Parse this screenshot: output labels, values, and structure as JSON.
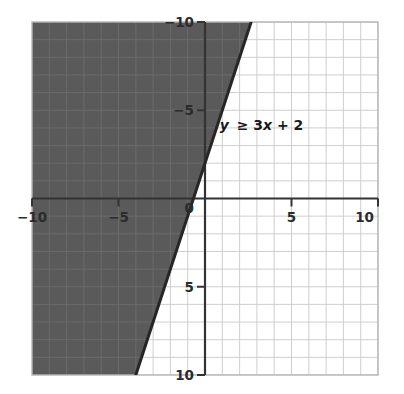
{
  "figure": {
    "kind": "inequality-graph",
    "background_color": "#ffffff"
  },
  "chart_data": {
    "type": "line",
    "title": "",
    "subtitle": "",
    "xlabel": "",
    "ylabel": "",
    "xlim": [
      -10,
      10
    ],
    "ylim": [
      -10,
      10
    ],
    "grid": true,
    "grid_step": 1,
    "legend_position": "none",
    "x_ticks": [
      -10,
      -5,
      0,
      5,
      10
    ],
    "y_ticks": [
      -10,
      -5,
      0,
      5,
      10
    ],
    "x_tick_labels": [
      "−10",
      "−5",
      "0",
      "5",
      "10"
    ],
    "y_tick_labels": [
      "10",
      "5",
      "0",
      "−5",
      "−10"
    ],
    "series": [
      {
        "name": "y = 3x + 2",
        "type": "line",
        "style": "solid",
        "slope": 3,
        "intercept": 2,
        "color": "#262626",
        "width": 3,
        "endpoints": [
          {
            "x": -4,
            "y": -10
          },
          {
            "x": 2.6667,
            "y": 10
          }
        ]
      }
    ],
    "shaded_regions": [
      {
        "name": "solution-region",
        "inequality": "y ≥ 3x + 2",
        "side": "above-left",
        "fill_color": "#5a5a5a",
        "opacity": 1,
        "polygon": [
          {
            "x": -10,
            "y": -10
          },
          {
            "x": -4,
            "y": -10
          },
          {
            "x": 2.6667,
            "y": 10
          },
          {
            "x": -10,
            "y": 10
          }
        ]
      }
    ],
    "annotations": [
      {
        "name": "inequality-label",
        "text": "y ≥ 3x + 2",
        "parts": {
          "variable": "y",
          "relation": "≥",
          "expression": "3x + 2"
        },
        "x": 0.85,
        "y": 3.9,
        "color": "#1a1a1a"
      }
    ],
    "colors": {
      "shade": "#5a5a5a",
      "boundary_line": "#262626",
      "axis": "#333333",
      "grid_light": "#c9c9c9",
      "grid_on_shade": "#6d6d6d",
      "tick_text": "#2b2b2b"
    }
  },
  "axes": {
    "x_axis_name": "x-axis",
    "y_axis_name": "y-axis",
    "origin_label": "0"
  }
}
